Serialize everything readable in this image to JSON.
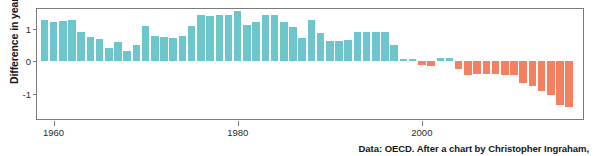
{
  "caption": "Data: OECD. After a chart by Christopher Ingraham,",
  "colors": {
    "positive": "#6cc6cc",
    "negative": "#f4805f",
    "axis": "#7b7b7b",
    "text": "#161616",
    "background": "#ffffff"
  },
  "chart_data": {
    "type": "bar",
    "title": "",
    "subtitle": "",
    "xlabel": "",
    "ylabel": "Difference in years",
    "xlim": [
      1958.2,
      2017.5
    ],
    "ylim": [
      -1.78,
      1.62
    ],
    "grid": false,
    "legend": null,
    "xticks": [
      1960,
      1980,
      2000
    ],
    "xticklabels": [
      "1960",
      "1980",
      "2000"
    ],
    "yticks": [
      1,
      0,
      -1
    ],
    "yticklabels": [
      "1",
      "0",
      "-1"
    ],
    "positive_color": "#6cc6cc",
    "negative_color": "#f4805f",
    "x": [
      1959,
      1960,
      1961,
      1962,
      1963,
      1964,
      1965,
      1966,
      1967,
      1968,
      1969,
      1970,
      1971,
      1972,
      1973,
      1974,
      1975,
      1976,
      1977,
      1978,
      1979,
      1980,
      1981,
      1982,
      1983,
      1984,
      1985,
      1986,
      1987,
      1988,
      1989,
      1990,
      1991,
      1992,
      1993,
      1994,
      1995,
      1996,
      1997,
      1998,
      1999,
      2000,
      2001,
      2002,
      2003,
      2004,
      2005,
      2006,
      2007,
      2008,
      2009,
      2010,
      2011,
      2012,
      2013,
      2014,
      2015,
      2016
    ],
    "values": [
      1.28,
      1.21,
      1.24,
      1.28,
      0.9,
      0.77,
      0.7,
      0.42,
      0.61,
      0.31,
      0.51,
      1.08,
      0.8,
      0.75,
      0.72,
      0.8,
      1.1,
      1.42,
      1.41,
      1.42,
      1.42,
      1.56,
      1.13,
      1.21,
      1.43,
      1.43,
      1.23,
      1.05,
      0.72,
      1.27,
      0.88,
      0.63,
      0.64,
      0.65,
      0.92,
      0.92,
      0.9,
      0.9,
      0.5,
      0.07,
      0.06,
      -0.12,
      -0.13,
      0.1,
      0.12,
      -0.22,
      -0.43,
      -0.39,
      -0.4,
      -0.39,
      -0.42,
      -0.43,
      -0.68,
      -0.76,
      -0.92,
      -1.04,
      -1.36,
      -1.42
    ],
    "categories": null
  }
}
